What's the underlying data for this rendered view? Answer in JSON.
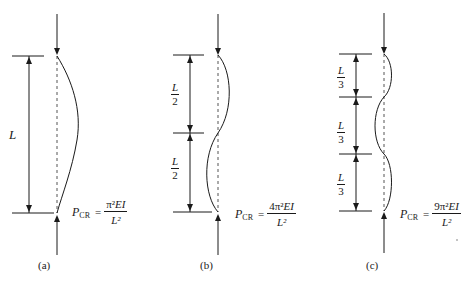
{
  "figure": {
    "panels": [
      {
        "id": "a",
        "caption": "(a)",
        "segments": [
          {
            "num": "L",
            "den": ""
          }
        ],
        "length_label": "L",
        "formula": {
          "lhs": "P",
          "sub": "CR",
          "eq": "=",
          "num_coef": "",
          "num_pi": "π²",
          "num_var": "EI",
          "den": "L²"
        },
        "mode": 1
      },
      {
        "id": "b",
        "caption": "(b)",
        "segments": [
          {
            "num": "L",
            "den": "2"
          },
          {
            "num": "L",
            "den": "2"
          }
        ],
        "formula": {
          "lhs": "P",
          "sub": "CR",
          "eq": "=",
          "num_coef": "4",
          "num_pi": "π²",
          "num_var": "EI",
          "den": "L²"
        },
        "mode": 2
      },
      {
        "id": "c",
        "caption": "(c)",
        "segments": [
          {
            "num": "L",
            "den": "3"
          },
          {
            "num": "L",
            "den": "3"
          },
          {
            "num": "L",
            "den": "3"
          }
        ],
        "formula": {
          "lhs": "P",
          "sub": "CR",
          "eq": "=",
          "num_coef": "9",
          "num_pi": "π²",
          "num_var": "EI",
          "den": "L²"
        },
        "mode": 3
      }
    ],
    "colors": {
      "ink": "#1a1a1a",
      "dashed": "#555555",
      "background": "#ffffff"
    }
  }
}
